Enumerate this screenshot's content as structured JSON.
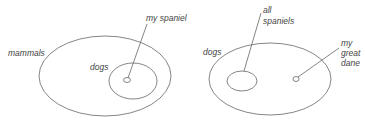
{
  "left_diagram": {
    "outer_label": "mammals",
    "inner_label": "dogs",
    "pointer_label": "my spaniel"
  },
  "right_diagram": {
    "outer_label": "dogs",
    "inner_pointer_label_line1": "all",
    "inner_pointer_label_line2": "spaniels",
    "point_label_line1": "my",
    "point_label_line2": "great",
    "point_label_line3": "dane"
  },
  "colors": {
    "stroke": "#666666",
    "text": "#444444",
    "background": "#ffffff"
  }
}
